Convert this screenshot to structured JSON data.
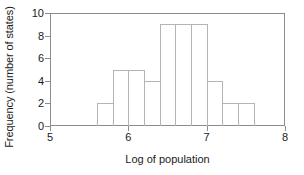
{
  "chart_data": {
    "type": "bar",
    "title": "",
    "subtitle": "",
    "xlabel": "Log of population",
    "ylabel": "Frequency (number of states)",
    "xlim": [
      5,
      8
    ],
    "ylim": [
      0,
      10
    ],
    "grid": false,
    "legend": null,
    "bin_width": 0.2,
    "bin_edges": [
      5.6,
      5.8,
      6.0,
      6.2,
      6.4,
      6.6,
      6.8,
      7.0,
      7.2,
      7.4,
      7.6
    ],
    "categories": [
      "5.6-5.8",
      "5.8-6.0",
      "6.0-6.2",
      "6.2-6.4",
      "6.4-6.6",
      "6.6-6.8",
      "6.8-7.0",
      "7.0-7.2",
      "7.2-7.4",
      "7.4-7.6"
    ],
    "values": [
      2,
      5,
      5,
      4,
      9,
      9,
      9,
      4,
      2,
      2
    ],
    "xticks": [
      {
        "value": 5,
        "label": "5"
      },
      {
        "value": 6,
        "label": "6"
      },
      {
        "value": 7,
        "label": "7"
      },
      {
        "value": 8,
        "label": "8"
      }
    ],
    "yticks": [
      {
        "value": 0,
        "label": "0"
      },
      {
        "value": 2,
        "label": "2"
      },
      {
        "value": 4,
        "label": "4"
      },
      {
        "value": 6,
        "label": "6"
      },
      {
        "value": 8,
        "label": "8"
      },
      {
        "value": 10,
        "label": "10"
      }
    ],
    "colors": {
      "bar_edge": "#b4b4b4",
      "bar_fill": "transparent",
      "axis": "#8c8c8c",
      "text": "#1a1a1a",
      "background": "#ffffff"
    }
  }
}
